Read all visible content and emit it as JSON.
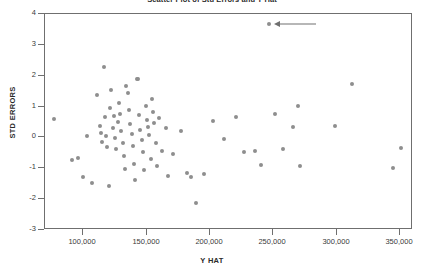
{
  "chart_data": {
    "type": "scatter",
    "title": "Scatter Plot of Std Errors and Y Hat",
    "xlabel": "Y HAT",
    "ylabel": "STD ERRORS",
    "xlim": [
      70000,
      360000
    ],
    "ylim": [
      -3,
      4
    ],
    "xticks": [
      100000,
      150000,
      200000,
      250000,
      300000,
      350000
    ],
    "xticklabels": [
      "100,000",
      "150,000",
      "200,000",
      "250,000",
      "300,000",
      "350,000"
    ],
    "yticks": [
      4,
      3,
      2,
      1,
      0,
      -1,
      -2,
      -3
    ],
    "yticklabels": [
      "4",
      "3",
      "2",
      "1",
      "0",
      "-1",
      "-2",
      "-3"
    ],
    "grid": false,
    "legend": null,
    "marker_color": "#8e8e8e",
    "frame_color": "#6f6f6f",
    "points": [
      [
        78000,
        0.56
      ],
      [
        92000,
        -0.78
      ],
      [
        97000,
        -0.7
      ],
      [
        101000,
        -1.3
      ],
      [
        104000,
        0.02
      ],
      [
        108000,
        -1.52
      ],
      [
        112000,
        1.33
      ],
      [
        114000,
        0.34
      ],
      [
        115000,
        0.1
      ],
      [
        116000,
        -0.18
      ],
      [
        117000,
        2.26
      ],
      [
        118000,
        0.62
      ],
      [
        119000,
        0.0
      ],
      [
        120000,
        -0.35
      ],
      [
        121000,
        -1.62
      ],
      [
        122000,
        0.92
      ],
      [
        123000,
        1.52
      ],
      [
        124000,
        0.26
      ],
      [
        125000,
        0.66
      ],
      [
        126000,
        -0.05
      ],
      [
        127000,
        -0.42
      ],
      [
        128000,
        0.46
      ],
      [
        129000,
        1.08
      ],
      [
        130000,
        0.74
      ],
      [
        131000,
        0.18
      ],
      [
        132000,
        -0.22
      ],
      [
        133000,
        -0.62
      ],
      [
        134000,
        -1.05
      ],
      [
        135000,
        1.62
      ],
      [
        136000,
        1.4
      ],
      [
        137000,
        0.86
      ],
      [
        138000,
        0.4
      ],
      [
        139000,
        0.08
      ],
      [
        140000,
        -0.3
      ],
      [
        141000,
        -0.88
      ],
      [
        142000,
        -1.42
      ],
      [
        143000,
        1.86
      ],
      [
        144000,
        1.86
      ],
      [
        145000,
        0.7
      ],
      [
        146000,
        0.22
      ],
      [
        147000,
        -0.1
      ],
      [
        148000,
        -0.52
      ],
      [
        149000,
        -1.1
      ],
      [
        150000,
        0.98
      ],
      [
        151000,
        0.54
      ],
      [
        152000,
        0.3
      ],
      [
        153000,
        0.04
      ],
      [
        154000,
        -0.74
      ],
      [
        155000,
        1.2
      ],
      [
        156000,
        0.8
      ],
      [
        157000,
        0.44
      ],
      [
        158000,
        -0.2
      ],
      [
        159000,
        -0.95
      ],
      [
        161000,
        0.6
      ],
      [
        163000,
        -0.48
      ],
      [
        166000,
        0.28
      ],
      [
        168000,
        -1.28
      ],
      [
        172000,
        -0.58
      ],
      [
        178000,
        0.18
      ],
      [
        183000,
        -1.18
      ],
      [
        186000,
        -1.32
      ],
      [
        190000,
        -2.15
      ],
      [
        196000,
        -1.22
      ],
      [
        203000,
        0.5
      ],
      [
        212000,
        -0.08
      ],
      [
        221000,
        0.62
      ],
      [
        228000,
        -0.52
      ],
      [
        236000,
        -0.48
      ],
      [
        241000,
        -0.92
      ],
      [
        247000,
        3.65
      ],
      [
        252000,
        0.72
      ],
      [
        258000,
        -0.4
      ],
      [
        266000,
        0.32
      ],
      [
        270000,
        0.98
      ],
      [
        272000,
        -0.95
      ],
      [
        299000,
        0.34
      ],
      [
        313000,
        1.7
      ],
      [
        345000,
        -1.02
      ],
      [
        351000,
        -0.38
      ]
    ],
    "annotations": [
      {
        "name": "outlier-arrow",
        "target_point": [
          247000,
          3.65
        ],
        "direction": "left",
        "text": ""
      }
    ]
  }
}
